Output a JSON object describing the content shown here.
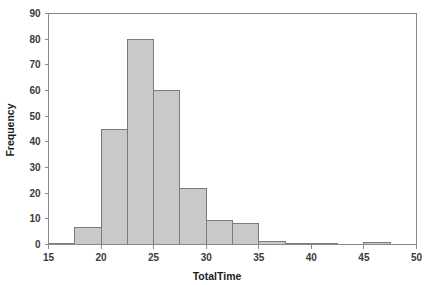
{
  "chart_data": {
    "type": "bar",
    "title": "",
    "subtitle": "",
    "xlabel": "TotalTime",
    "ylabel": "Frequency",
    "xlim": [
      15,
      50
    ],
    "ylim": [
      0,
      90
    ],
    "xticks": [
      15,
      20,
      25,
      30,
      35,
      40,
      45,
      50
    ],
    "xtick_labels": [
      "15",
      "20",
      "25",
      "30",
      "35",
      "40",
      "45",
      "50"
    ],
    "yticks": [
      0,
      10,
      20,
      30,
      40,
      50,
      60,
      70,
      80,
      90
    ],
    "ytick_labels": [
      "0",
      "10",
      "20",
      "30",
      "40",
      "50",
      "60",
      "70",
      "80",
      "90"
    ],
    "grid": false,
    "legend": false,
    "legend_position": "none",
    "bin_width": 2.5,
    "bin_edges": [
      15,
      17.5,
      20,
      22.5,
      25,
      27.5,
      30,
      32.5,
      35,
      37.5,
      40,
      42.5,
      45,
      47.5,
      50
    ],
    "categories": [
      "15-17.5",
      "17.5-20",
      "20-22.5",
      "22.5-25",
      "25-27.5",
      "27.5-30",
      "30-32.5",
      "32.5-35",
      "35-37.5",
      "37.5-40",
      "40-42.5",
      "42.5-45",
      "45-47.5",
      "47.5-50"
    ],
    "values": [
      0.5,
      6.5,
      45,
      80,
      60,
      22,
      9.3,
      8.3,
      1.2,
      0.3,
      0.3,
      0,
      0.8,
      0
    ],
    "bar_fill_color": "#c9c9c9",
    "bar_edge_color": "#7a7a7a",
    "axis_color": "#8a8a8a",
    "text_color": "#2b2b2b",
    "background_color": "#ffffff"
  }
}
